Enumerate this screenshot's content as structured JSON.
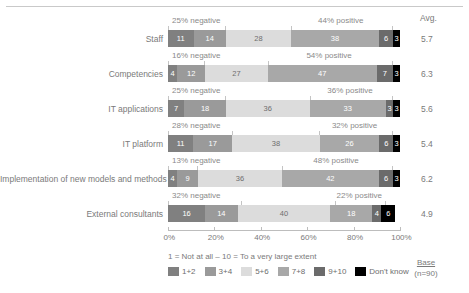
{
  "header": {
    "avg_label": "Avg."
  },
  "chart_data": {
    "type": "bar",
    "subtype": "stacked-100-horizontal",
    "title": "",
    "xlabel": "",
    "ylabel": "",
    "xlim": [
      0,
      100
    ],
    "grid": false,
    "legend_position": "bottom-left",
    "categories": [
      "Staff",
      "Competencies",
      "IT applications",
      "IT platform",
      "Implementation of new models and methods",
      "External consultants"
    ],
    "series": [
      {
        "name": "1+2",
        "color": "#808080",
        "values": [
          11,
          4,
          7,
          11,
          4,
          16
        ]
      },
      {
        "name": "3+4",
        "color": "#9a9a9a",
        "values": [
          14,
          12,
          18,
          17,
          9,
          14
        ]
      },
      {
        "name": "5+6",
        "color": "#dcdcdc",
        "values": [
          28,
          27,
          36,
          38,
          36,
          40
        ]
      },
      {
        "name": "7+8",
        "color": "#a8a8a8",
        "values": [
          38,
          47,
          33,
          26,
          42,
          18
        ]
      },
      {
        "name": "9+10",
        "color": "#6b6b6b",
        "values": [
          6,
          7,
          3,
          6,
          6,
          4
        ]
      },
      {
        "name": "Don't know",
        "color": "#000000",
        "values": [
          3,
          3,
          3,
          3,
          3,
          6
        ]
      }
    ],
    "averages": [
      5.7,
      6.3,
      5.6,
      5.4,
      6.2,
      4.9
    ],
    "negative_labels": [
      "25% negative",
      "16% negative",
      "25% negative",
      "28% negative",
      "13% negative",
      "32% negative"
    ],
    "positive_labels": [
      "44% positive",
      "54% positive",
      "36% positive",
      "32% positive",
      "48% positive",
      "22% positive"
    ],
    "negative_spans": [
      25,
      16,
      25,
      28,
      13,
      32
    ],
    "positive_spans": [
      44,
      54,
      36,
      32,
      48,
      22
    ],
    "xticks": [
      0,
      20,
      40,
      60,
      80,
      100
    ],
    "xticklabels": [
      "0%",
      "20%",
      "40%",
      "60%",
      "80%",
      "100%"
    ]
  },
  "footer": {
    "scale_note": "1 = Not at all – 10 = To a very large extent",
    "base_title": "Base",
    "base_n": "(n=90)"
  },
  "colors": {
    "s1": "#808080",
    "s2": "#9a9a9a",
    "s3": "#dcdcdc",
    "s4": "#a8a8a8",
    "s5": "#6b6b6b",
    "s6": "#000000",
    "text": "#7a7a7a",
    "rule": "#c9c9c9"
  }
}
